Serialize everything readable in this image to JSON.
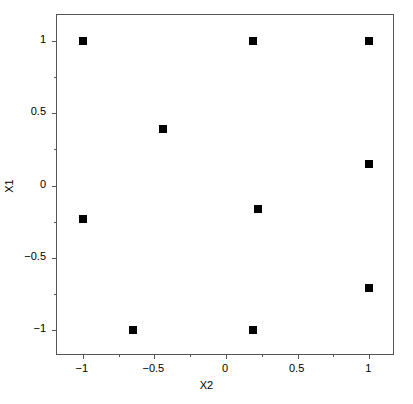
{
  "chart_data": {
    "type": "scatter",
    "title": "",
    "subtitle": "",
    "xlabel": "X2",
    "ylabel": "X1",
    "xlim": [
      -1.18,
      1.18
    ],
    "ylim": [
      -1.18,
      1.18
    ],
    "grid": false,
    "legend": null,
    "legend_position": "none",
    "marker": {
      "shape": "square",
      "color": "#000000",
      "size_px": 8
    },
    "x_ticks": [
      {
        "value": -1,
        "label": "−1"
      },
      {
        "value": -0.5,
        "label": "−0.5"
      },
      {
        "value": 0,
        "label": "0"
      },
      {
        "value": 0.5,
        "label": "0.5"
      },
      {
        "value": 1,
        "label": "1"
      }
    ],
    "x_minor_ticks": [
      -0.75,
      -0.25,
      0.25,
      0.75
    ],
    "y_ticks": [
      {
        "value": 1,
        "label": "1"
      },
      {
        "value": 0.5,
        "label": "0.5"
      },
      {
        "value": 0,
        "label": "0"
      },
      {
        "value": -0.5,
        "label": "−0.5"
      },
      {
        "value": -1,
        "label": "−1"
      }
    ],
    "y_minor_ticks": [
      0.75,
      0.25,
      -0.25,
      -0.75
    ],
    "points": [
      {
        "x": -1,
        "y": 1
      },
      {
        "x": 0.19,
        "y": 1
      },
      {
        "x": 1,
        "y": 1
      },
      {
        "x": -0.44,
        "y": 0.39
      },
      {
        "x": 1,
        "y": 0.15
      },
      {
        "x": 0.22,
        "y": -0.16
      },
      {
        "x": -1,
        "y": -0.23
      },
      {
        "x": 1,
        "y": -0.71
      },
      {
        "x": -0.65,
        "y": -1
      },
      {
        "x": 0.19,
        "y": -1
      }
    ]
  }
}
